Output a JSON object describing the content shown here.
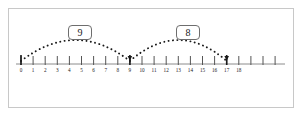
{
  "figure": {
    "type": "number-line-jumps",
    "background_color": "#ffffff",
    "frame_color": "#c8c8c8",
    "line_color": "#8c8c8c",
    "tick_color": "#555555",
    "dot_color": "#1a1a1a",
    "label_text_color": "#1a1a1a",
    "label_border_color": "#6e6e6e"
  },
  "number_line": {
    "start_value": 0,
    "end_value": 21,
    "tick_labels": [
      "0",
      "1",
      "2",
      "3",
      "4",
      "5",
      "6",
      "7",
      "8",
      "9",
      "10",
      "11",
      "12",
      "13",
      "14",
      "15",
      "16",
      "17",
      "18"
    ],
    "unlabeled_tick_values": [
      19,
      20,
      21
    ],
    "axis_start_x": 16,
    "axis_end_x": 285,
    "axis_y": 64,
    "tick_spacing": 12.1,
    "first_tick_x": 21
  },
  "jumps": [
    {
      "label": "9",
      "from_value": 0,
      "to_value": 9,
      "size": 9,
      "direction": "right",
      "label_box_x": 68,
      "label_box_y": 25,
      "apex_y": 30
    },
    {
      "label": "8",
      "from_value": 9,
      "to_value": 17,
      "size": 8,
      "direction": "right",
      "label_box_x": 176,
      "label_box_y": 25,
      "apex_y": 30
    }
  ],
  "endpoints": {
    "start_marker_value": 0,
    "landing_marker_values": [
      9,
      17
    ]
  }
}
